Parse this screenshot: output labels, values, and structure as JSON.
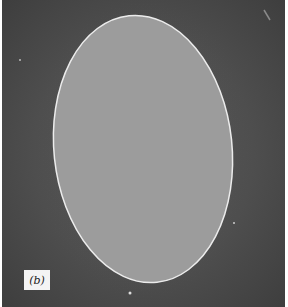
{
  "figure": {
    "panel_label": "(b)",
    "colors": {
      "background": "#4e4e4e",
      "cell_fill": "#9c9c9c",
      "cell_outline": "#e8e8e8",
      "label_bg": "#f4f4f4"
    }
  }
}
